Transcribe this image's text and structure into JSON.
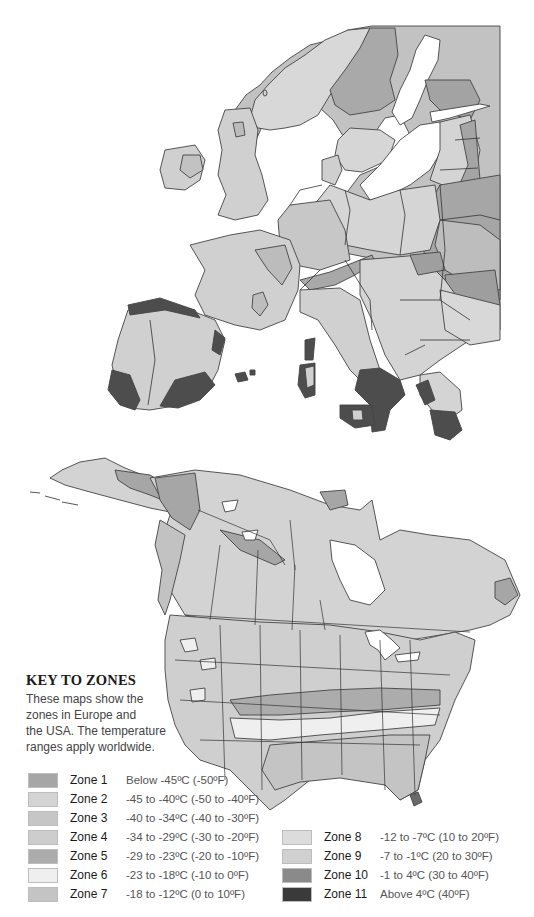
{
  "key": {
    "title": "KEY TO ZONES",
    "description_lines": [
      "These maps show the",
      "zones in Europe and",
      "the USA. The temperature",
      "ranges apply worldwide."
    ]
  },
  "legend": {
    "zones": [
      {
        "name": "Zone 1",
        "range": "Below -45ºC (-50ºF)",
        "color": "#a6a6a6"
      },
      {
        "name": "Zone 2",
        "range": "-45 to -40ºC (-50 to -40ºF)",
        "color": "#d4d4d4"
      },
      {
        "name": "Zone 3",
        "range": "-40 to -34ºC (-40 to -30ºF)",
        "color": "#c6c6c6"
      },
      {
        "name": "Zone 4",
        "range": "-34 to -29ºC (-30 to -20ºF)",
        "color": "#cdcdcd"
      },
      {
        "name": "Zone 5",
        "range": "-29 to -23ºC (-20 to -10ºF)",
        "color": "#acacac"
      },
      {
        "name": "Zone 6",
        "range": "-23 to -18ºC (-10 to 0ºF)",
        "color": "#efefef"
      },
      {
        "name": "Zone 7",
        "range": "-18 to -12ºC (0 to 10ºF)",
        "color": "#c4c4c4"
      },
      {
        "name": "Zone 8",
        "range": "-12 to -7ºC (10 to 20ºF)",
        "color": "#dcdcdc"
      },
      {
        "name": "Zone 9",
        "range": "-7 to -1ºC (20 to 30ºF)",
        "color": "#d0d0d0"
      },
      {
        "name": "Zone 10",
        "range": "-1 to 4ºC (30 to 40ºF)",
        "color": "#8a8a8a"
      },
      {
        "name": "Zone 11",
        "range": "Above 4ºC (40ºF)",
        "color": "#3a3a3a"
      }
    ]
  },
  "maps": [
    {
      "region": "Europe"
    },
    {
      "region": "North America"
    }
  ]
}
